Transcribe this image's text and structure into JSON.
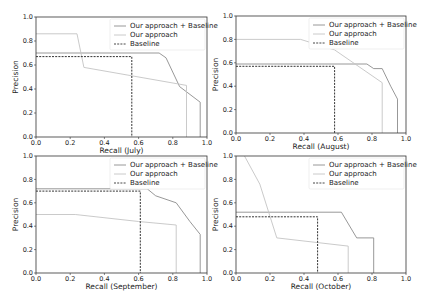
{
  "chart_data": [
    {
      "type": "line",
      "title": "",
      "xlabel": "Recall (July)",
      "ylabel": "Precision",
      "xlim": [
        0,
        1
      ],
      "ylim": [
        0,
        1
      ],
      "xticks": [
        "0.0",
        "0.2",
        "0.4",
        "0.6",
        "0.8",
        "1.0"
      ],
      "yticks": [
        "0.0",
        "0.2",
        "0.4",
        "0.6",
        "0.8",
        "1.0"
      ],
      "grid": false,
      "legend_position": "upper right",
      "series": [
        {
          "name": "Our approach + Baseline",
          "x": [
            0.0,
            0.72,
            0.76,
            0.84,
            0.96,
            0.96
          ],
          "y": [
            0.7,
            0.7,
            0.66,
            0.42,
            0.29,
            0.0
          ]
        },
        {
          "name": "Our approach",
          "x": [
            0.0,
            0.24,
            0.28,
            0.88,
            0.88
          ],
          "y": [
            0.86,
            0.86,
            0.58,
            0.43,
            0.0
          ]
        },
        {
          "name": "Baseline",
          "x": [
            0.0,
            0.56,
            0.56
          ],
          "y": [
            0.67,
            0.67,
            0.0
          ]
        }
      ]
    },
    {
      "type": "line",
      "title": "",
      "xlabel": "Recall (August)",
      "ylabel": "Precision",
      "xlim": [
        0,
        1
      ],
      "ylim": [
        0,
        1
      ],
      "xticks": [
        "0.0",
        "0.2",
        "0.4",
        "0.6",
        "0.8",
        "1.0"
      ],
      "yticks": [
        "0.0",
        "0.2",
        "0.4",
        "0.6",
        "0.8",
        "1.0"
      ],
      "grid": false,
      "legend_position": "upper right",
      "series": [
        {
          "name": "Our approach + Baseline",
          "x": [
            0.0,
            0.77,
            0.81,
            0.86,
            0.91,
            0.95,
            0.95
          ],
          "y": [
            0.59,
            0.59,
            0.55,
            0.55,
            0.4,
            0.29,
            0.0
          ]
        },
        {
          "name": "Our approach",
          "x": [
            0.0,
            0.38,
            0.58,
            0.86,
            0.86
          ],
          "y": [
            0.8,
            0.8,
            0.71,
            0.43,
            0.0
          ]
        },
        {
          "name": "Baseline",
          "x": [
            0.0,
            0.58,
            0.58
          ],
          "y": [
            0.57,
            0.57,
            0.0
          ]
        }
      ]
    },
    {
      "type": "line",
      "title": "",
      "xlabel": "Recall (September)",
      "ylabel": "Precision",
      "xlim": [
        0,
        1
      ],
      "ylim": [
        0,
        1
      ],
      "xticks": [
        "0.0",
        "0.2",
        "0.4",
        "0.6",
        "0.8",
        "1.0"
      ],
      "yticks": [
        "0.0",
        "0.2",
        "0.4",
        "0.6",
        "0.8",
        "1.0"
      ],
      "grid": false,
      "legend_position": "upper right",
      "series": [
        {
          "name": "Our approach + Baseline",
          "x": [
            0.0,
            0.65,
            0.7,
            0.82,
            0.9,
            0.96,
            0.96
          ],
          "y": [
            0.72,
            0.72,
            0.66,
            0.6,
            0.44,
            0.33,
            0.0
          ]
        },
        {
          "name": "Our approach",
          "x": [
            0.0,
            0.23,
            0.6,
            0.82,
            0.82
          ],
          "y": [
            0.5,
            0.5,
            0.44,
            0.41,
            0.0
          ]
        },
        {
          "name": "Baseline",
          "x": [
            0.0,
            0.61,
            0.61
          ],
          "y": [
            0.7,
            0.7,
            0.0
          ]
        }
      ]
    },
    {
      "type": "line",
      "title": "",
      "xlabel": "Recall (October)",
      "ylabel": "Precision",
      "xlim": [
        0,
        1
      ],
      "ylim": [
        0,
        1
      ],
      "xticks": [
        "0.0",
        "0.2",
        "0.4",
        "0.6",
        "0.8",
        "1.0"
      ],
      "yticks": [
        "0.0",
        "0.2",
        "0.4",
        "0.6",
        "0.8",
        "1.0"
      ],
      "grid": false,
      "legend_position": "upper right",
      "series": [
        {
          "name": "Our approach + Baseline",
          "x": [
            0.0,
            0.62,
            0.71,
            0.81,
            0.81
          ],
          "y": [
            0.52,
            0.52,
            0.3,
            0.3,
            0.0
          ]
        },
        {
          "name": "Our approach",
          "x": [
            0.05,
            0.14,
            0.24,
            0.66,
            0.66
          ],
          "y": [
            1.0,
            0.76,
            0.3,
            0.23,
            0.0
          ]
        },
        {
          "name": "Baseline",
          "x": [
            0.0,
            0.48,
            0.48
          ],
          "y": [
            0.48,
            0.48,
            0.0
          ]
        }
      ]
    }
  ],
  "styles": {
    "Our approach + Baseline": {
      "color": "#8c8c8c",
      "dash": ""
    },
    "Our approach": {
      "color": "#c4c4c4",
      "dash": ""
    },
    "Baseline": {
      "color": "#333333",
      "dash": "2,1.2"
    }
  },
  "panels": [
    {
      "x0": 36,
      "x1": 207,
      "ytop": 17,
      "ybot": 137
    },
    {
      "x0": 236,
      "x1": 406,
      "ytop": 16,
      "ybot": 133
    },
    {
      "x0": 36,
      "x1": 207,
      "ytop": 156,
      "ybot": 273
    },
    {
      "x0": 236,
      "x1": 406,
      "ytop": 156,
      "ybot": 273
    }
  ],
  "legend": {
    "entries": [
      "Our approach + Baseline",
      "Our approach",
      "Baseline"
    ]
  }
}
